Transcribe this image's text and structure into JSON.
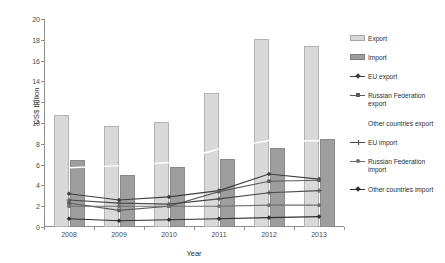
{
  "chart_data": {
    "type": "bar",
    "title": "",
    "subtitle": "",
    "xlabel": "Year",
    "ylabel": "US$ billion",
    "categories": [
      "2008",
      "2009",
      "2010",
      "2011",
      "2012",
      "2013"
    ],
    "ylim": [
      0,
      20
    ],
    "yticks": [
      0,
      2,
      4,
      6,
      8,
      10,
      12,
      14,
      16,
      18,
      20
    ],
    "grid": false,
    "legend_position": "right",
    "series": [
      {
        "name": "Export",
        "kind": "bar",
        "color": "#d9d9d9",
        "values": [
          10.8,
          9.7,
          10.1,
          12.9,
          18.1,
          17.4
        ]
      },
      {
        "name": "Import",
        "kind": "bar",
        "color": "#9e9e9e",
        "values": [
          6.4,
          5.0,
          5.8,
          6.5,
          7.6,
          8.5
        ]
      },
      {
        "name": "EU export",
        "kind": "line",
        "marker": "diamond",
        "color": "#3f3f3f",
        "values": [
          3.2,
          2.6,
          2.9,
          3.5,
          5.1,
          4.6
        ]
      },
      {
        "name": "Russian Federation export",
        "kind": "line",
        "marker": "square",
        "color": "#5a5a5a",
        "values": [
          2.3,
          1.6,
          2.0,
          3.4,
          4.4,
          4.5
        ]
      },
      {
        "name": "Other countries export",
        "kind": "line",
        "marker": "none",
        "color": "#ffffff",
        "values": [
          5.7,
          5.9,
          6.2,
          7.5,
          8.3,
          8.3
        ]
      },
      {
        "name": "EU import",
        "kind": "line",
        "marker": "plus",
        "color": "#4a4a4a",
        "values": [
          2.6,
          2.3,
          2.2,
          2.7,
          3.3,
          3.5
        ]
      },
      {
        "name": "Russian Federation import",
        "kind": "line",
        "marker": "circle",
        "color": "#6e6e6e",
        "values": [
          2.0,
          2.0,
          2.0,
          2.0,
          2.1,
          2.1
        ]
      },
      {
        "name": "Other countries import",
        "kind": "line",
        "marker": "diamond",
        "color": "#2f2f2f",
        "values": [
          0.8,
          0.6,
          0.7,
          0.8,
          0.9,
          1.0
        ]
      }
    ]
  },
  "legend": {
    "items": [
      {
        "label": "Export",
        "type": "swatch-export"
      },
      {
        "label": "Import",
        "type": "swatch-import"
      },
      {
        "label": "EU export",
        "type": "line-diamond"
      },
      {
        "label": "Russian Federation export",
        "type": "line-square"
      },
      {
        "label": "Other countries export",
        "type": "none"
      },
      {
        "label": "EU import",
        "type": "line-plus"
      },
      {
        "label": "Russian Federation import",
        "type": "line-circle"
      },
      {
        "label": "Other countries import",
        "type": "line-diamond"
      }
    ]
  },
  "axes": {
    "y_title": "US$ billion",
    "x_title": "Year"
  }
}
